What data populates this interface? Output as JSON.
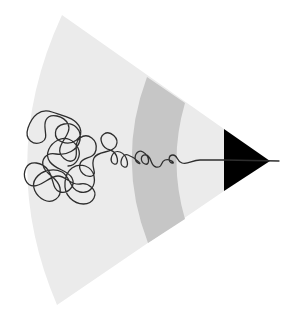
{
  "illustration": {
    "subject": "pencil drawing a tangled scribble",
    "colors": {
      "background": "#ffffff",
      "pencil_body": "#ebebeb",
      "pencil_band": "#c6c6c6",
      "pencil_tip": "#000000",
      "scribble_line": "#2e2e2e"
    }
  }
}
